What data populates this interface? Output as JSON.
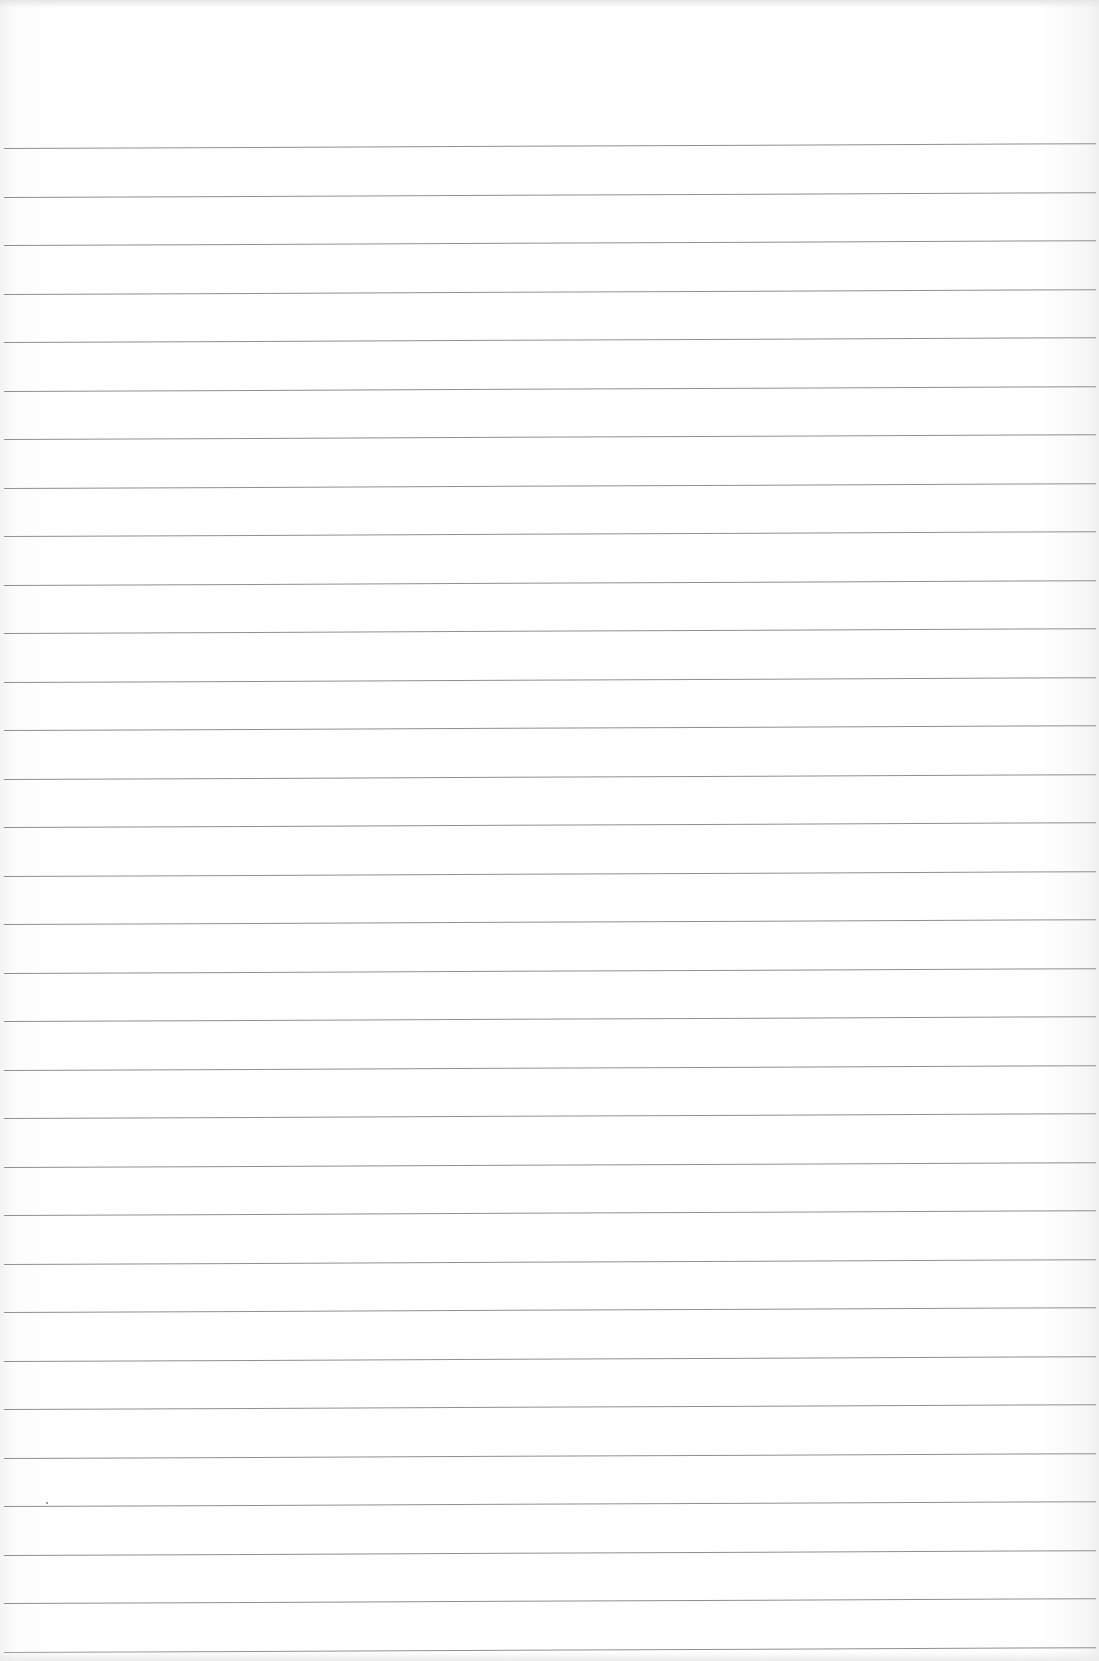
{
  "document": {
    "type": "blank ruled notebook page",
    "text": "",
    "rule_color": "#8f8f8f",
    "paper_color": "#ffffff",
    "rules_count": 32,
    "rule_first_y": 148,
    "rule_spacing": 48.5
  }
}
